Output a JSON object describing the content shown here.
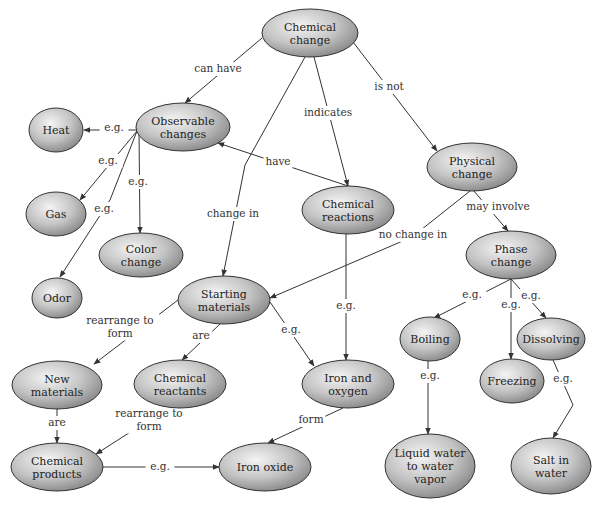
{
  "diagram": {
    "type": "concept-map",
    "nodes": [
      {
        "id": "chemical_change",
        "lines": [
          "Chemical",
          "change"
        ],
        "cx": 310,
        "cy": 33,
        "rx": 48,
        "ry": 24
      },
      {
        "id": "observable_changes",
        "lines": [
          "Observable",
          "changes"
        ],
        "cx": 183,
        "cy": 127,
        "rx": 47,
        "ry": 24
      },
      {
        "id": "heat",
        "lines": [
          "Heat"
        ],
        "cx": 56,
        "cy": 130,
        "rx": 27,
        "ry": 22
      },
      {
        "id": "gas",
        "lines": [
          "Gas"
        ],
        "cx": 56,
        "cy": 214,
        "rx": 30,
        "ry": 22
      },
      {
        "id": "color_change",
        "lines": [
          "Color",
          "change"
        ],
        "cx": 141,
        "cy": 255,
        "rx": 42,
        "ry": 22
      },
      {
        "id": "odor",
        "lines": [
          "Odor"
        ],
        "cx": 57,
        "cy": 298,
        "rx": 25,
        "ry": 20
      },
      {
        "id": "chemical_reactions",
        "lines": [
          "Chemical",
          "reactions"
        ],
        "cx": 348,
        "cy": 210,
        "rx": 46,
        "ry": 24
      },
      {
        "id": "physical_change",
        "lines": [
          "Physical",
          "change"
        ],
        "cx": 472,
        "cy": 167,
        "rx": 45,
        "ry": 24
      },
      {
        "id": "phase_change",
        "lines": [
          "Phase",
          "change"
        ],
        "cx": 511,
        "cy": 255,
        "rx": 45,
        "ry": 24
      },
      {
        "id": "starting_materials",
        "lines": [
          "Starting",
          "materials"
        ],
        "cx": 224,
        "cy": 300,
        "rx": 46,
        "ry": 24
      },
      {
        "id": "new_materials",
        "lines": [
          "New",
          "materials"
        ],
        "cx": 57,
        "cy": 385,
        "rx": 45,
        "ry": 24
      },
      {
        "id": "chemical_reactants",
        "lines": [
          "Chemical",
          "reactants"
        ],
        "cx": 180,
        "cy": 384,
        "rx": 46,
        "ry": 24
      },
      {
        "id": "iron_and_oxygen",
        "lines": [
          "Iron and",
          "oxygen"
        ],
        "cx": 348,
        "cy": 384,
        "rx": 46,
        "ry": 24
      },
      {
        "id": "boiling",
        "lines": [
          "Boiling"
        ],
        "cx": 430,
        "cy": 339,
        "rx": 30,
        "ry": 22
      },
      {
        "id": "dissolving",
        "lines": [
          "Dissolving"
        ],
        "cx": 551,
        "cy": 339,
        "rx": 34,
        "ry": 21
      },
      {
        "id": "freezing",
        "lines": [
          "Freezing"
        ],
        "cx": 512,
        "cy": 381,
        "rx": 32,
        "ry": 22
      },
      {
        "id": "chemical_products",
        "lines": [
          "Chemical",
          "products"
        ],
        "cx": 57,
        "cy": 467,
        "rx": 46,
        "ry": 24
      },
      {
        "id": "iron_oxide",
        "lines": [
          "Iron oxide"
        ],
        "cx": 265,
        "cy": 467,
        "rx": 46,
        "ry": 24
      },
      {
        "id": "liquid_water",
        "lines": [
          "Liquid water",
          "to water",
          "vapor"
        ],
        "cx": 430,
        "cy": 466,
        "rx": 45,
        "ry": 32
      },
      {
        "id": "salt_in_water",
        "lines": [
          "Salt in",
          "water"
        ],
        "cx": 551,
        "cy": 466,
        "rx": 40,
        "ry": 28
      }
    ],
    "edges": [
      {
        "from": "chemical_change",
        "to": "observable_changes",
        "label": "can have",
        "lx": 218,
        "ly": 72
      },
      {
        "from": "chemical_change",
        "to": "starting_materials",
        "label": "change in",
        "lx": 233,
        "ly": 217
      },
      {
        "from": "chemical_change",
        "to": "chemical_reactions",
        "label": "indicates",
        "lx": 328,
        "ly": 116
      },
      {
        "from": "chemical_change",
        "to": "physical_change",
        "label": "is not",
        "lx": 389,
        "ly": 90
      },
      {
        "from": "observable_changes",
        "to": "heat",
        "label": "e.g.",
        "lx": 114,
        "ly": 131
      },
      {
        "from": "observable_changes",
        "to": "gas",
        "label": "e.g.",
        "lx": 108,
        "ly": 164
      },
      {
        "from": "observable_changes",
        "to": "color_change",
        "label": "e.g.",
        "lx": 138,
        "ly": 185
      },
      {
        "from": "observable_changes",
        "to": "odor",
        "label": "e.g.",
        "lx": 104,
        "ly": 212
      },
      {
        "from": "chemical_reactions",
        "to": "observable_changes",
        "label": "have",
        "lx": 278,
        "ly": 165
      },
      {
        "from": "chemical_reactions",
        "to": "iron_and_oxygen",
        "label": "e.g.",
        "lx": 346,
        "ly": 309
      },
      {
        "from": "physical_change",
        "to": "starting_materials",
        "label": "no change in",
        "lx": 413,
        "ly": 238
      },
      {
        "from": "physical_change",
        "to": "phase_change",
        "label": "may involve",
        "lx": 498,
        "ly": 210
      },
      {
        "from": "phase_change",
        "to": "boiling",
        "label": "e.g.",
        "lx": 472,
        "ly": 298
      },
      {
        "from": "phase_change",
        "to": "freezing",
        "label": "e.g.",
        "lx": 511,
        "ly": 308
      },
      {
        "from": "phase_change",
        "to": "dissolving",
        "label": "e.g.",
        "lx": 531,
        "ly": 299
      },
      {
        "from": "starting_materials",
        "to": "new_materials",
        "label": "rearrange to form",
        "lx": 120,
        "ly": 330
      },
      {
        "from": "starting_materials",
        "to": "chemical_reactants",
        "label": "are",
        "lx": 201,
        "ly": 339
      },
      {
        "from": "starting_materials",
        "to": "iron_and_oxygen",
        "label": "e.g.",
        "lx": 291,
        "ly": 333
      },
      {
        "from": "new_materials",
        "to": "chemical_products",
        "label": "are",
        "lx": 57,
        "ly": 426
      },
      {
        "from": "chemical_reactants",
        "to": "chemical_products",
        "label": "rearrange to form",
        "lx": 149,
        "ly": 423
      },
      {
        "from": "iron_and_oxygen",
        "to": "iron_oxide",
        "label": "form",
        "lx": 311,
        "ly": 423
      },
      {
        "from": "chemical_products",
        "to": "iron_oxide",
        "label": "e.g.",
        "lx": 160,
        "ly": 470
      },
      {
        "from": "boiling",
        "to": "liquid_water",
        "label": "e.g.",
        "lx": 430,
        "ly": 379
      },
      {
        "from": "dissolving",
        "to": "salt_in_water",
        "label": "e.g.",
        "lx": 563,
        "ly": 382
      }
    ]
  },
  "colors": {
    "node_fill_light": "#f2f2f2",
    "node_fill_dark": "#8a8a8a",
    "node_stroke": "#333333",
    "edge": "#333333",
    "text": "#222222"
  }
}
